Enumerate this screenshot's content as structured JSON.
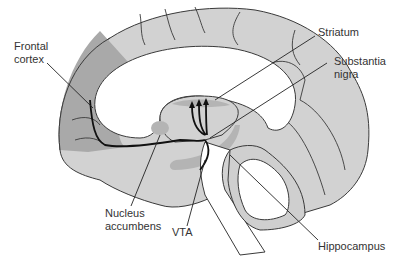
{
  "diagram": {
    "type": "sagittal brain section - mesolimbic/mesocortical dopamine pathways",
    "colors": {
      "brain_fill": "#d2d2d2",
      "frontal_fill": "#a9a9a9",
      "region_fill": "#b4b4b4",
      "outline": "#3a3a3a",
      "pathway": "#111111",
      "background": "#ffffff"
    },
    "labels": {
      "frontal_cortex": [
        "Frontal",
        "cortex"
      ],
      "striatum": [
        "Striatum"
      ],
      "substantia_nigra": [
        "Substantia",
        "nigra"
      ],
      "nucleus_accumbens": [
        "Nucleus",
        "accumbens"
      ],
      "vta": [
        "VTA"
      ],
      "hippocampus": [
        "Hippocampus"
      ]
    }
  }
}
